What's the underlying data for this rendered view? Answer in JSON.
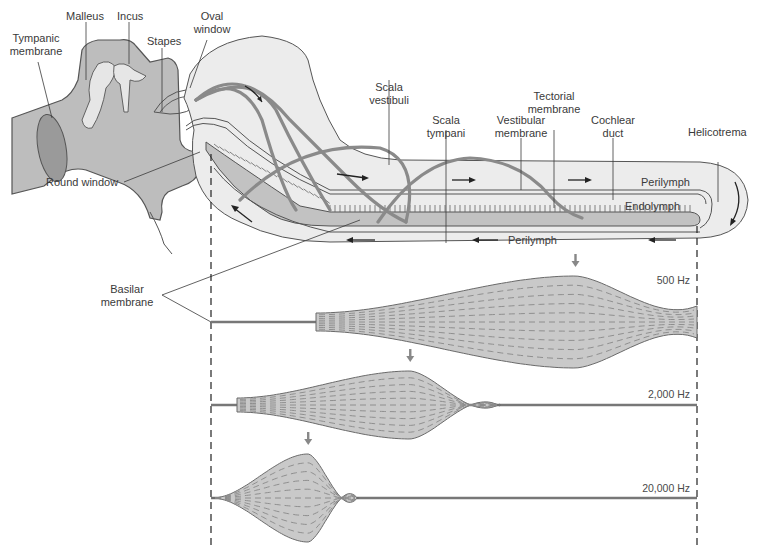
{
  "labels": {
    "tympanic_membrane": [
      "Tympanic",
      "membrane"
    ],
    "malleus": "Malleus",
    "incus": "Incus",
    "stapes": "Stapes",
    "oval_window": [
      "Oval",
      "window"
    ],
    "round_window": "Round window",
    "scala_vestibuli": [
      "Scala",
      "vestibuli"
    ],
    "scala_tympani": [
      "Scala",
      "tympani"
    ],
    "vestibular_membrane": [
      "Vestibular",
      "membrane"
    ],
    "tectorial_membrane": [
      "Tectorial",
      "membrane"
    ],
    "cochlear_duct": [
      "Cochlear",
      "duct"
    ],
    "helicotrema": "Helicotrema",
    "perilymph_upper": "Perilymph",
    "endolymph": "Endolymph",
    "perilymph_lower": "Perilymph",
    "basilar_membrane": [
      "Basilar",
      "membrane"
    ]
  },
  "frequency_panels": [
    {
      "label": "500 Hz",
      "peak_position": 0.75,
      "note": "Low frequency — maximal displacement near apex (helicotrema)"
    },
    {
      "label": "2,000 Hz",
      "peak_position": 0.41,
      "note": "Mid frequency — maximal displacement mid-cochlea"
    },
    {
      "label": "20,000 Hz",
      "peak_position": 0.2,
      "note": "High frequency — maximal displacement near base (oval window)"
    }
  ],
  "colors": {
    "tissue_gray": "#b9b9b9",
    "cochlea_fill": "#ececec",
    "membrane_fill": "#c9c9c9",
    "wave_gray": "#8a8a8a",
    "text": "#3a3a3a"
  }
}
